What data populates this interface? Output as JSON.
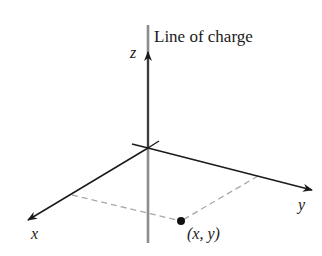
{
  "diagram": {
    "title_label": "Line of charge",
    "axes": {
      "z_label": "z",
      "x_label": "x",
      "y_label": "y"
    },
    "point": {
      "label": "(x, y)",
      "x_label": "x",
      "y_label": "y"
    },
    "colors": {
      "axis": "#1a1a1a",
      "line_of_charge": "#8c8c8c",
      "dashed": "#a8a8a8",
      "point": "#111111"
    }
  }
}
